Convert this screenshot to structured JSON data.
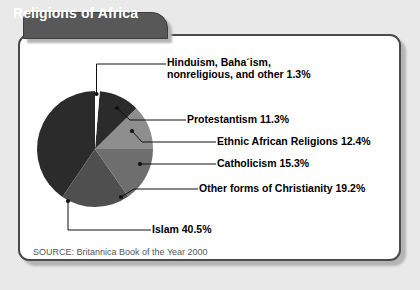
{
  "page": {
    "background_color": "#e9e9e9",
    "panel_background": "#ffffff",
    "panel_border_color": "#4a4a4a"
  },
  "header": {
    "title": "Religions of Africa",
    "tab_background": "#585858",
    "tab_text_color": "#ffffff"
  },
  "source": {
    "text": "SOURCE: Britannica Book of the Year 2000"
  },
  "chart_data": {
    "type": "pie",
    "title": "Religions of Africa",
    "grid": false,
    "legend_position": "callout-labels-right",
    "total": 100.0,
    "units": "percent",
    "categories": [
      "Hinduism, Baha´ism, nonreligious, and other",
      "Protestantism",
      "Ethnic African Religions",
      "Catholicism",
      "Other forms of Christianity",
      "Islam"
    ],
    "values": [
      1.3,
      11.3,
      12.4,
      15.3,
      19.2,
      40.5
    ],
    "colors": [
      "#ffffff",
      "#2b2b2b",
      "#8e8e8e",
      "#6e6e6e",
      "#4f4f4f",
      "#2b2b2b"
    ],
    "slices": [
      {
        "label_line1": "Hinduism, Baha´ism,",
        "label_line2": "nonreligious, and other 1.3%",
        "label": "Hinduism, Baha´ism, nonreligious, and other 1.3%",
        "value": 1.3,
        "color": "#ffffff"
      },
      {
        "label": "Protestantism 11.3%",
        "value": 11.3,
        "color": "#2b2b2b"
      },
      {
        "label": "Ethnic African Religions 12.4%",
        "value": 12.4,
        "color": "#8e8e8e"
      },
      {
        "label": "Catholicism 15.3%",
        "value": 15.3,
        "color": "#6e6e6e"
      },
      {
        "label": "Other forms of Christianity 19.2%",
        "value": 19.2,
        "color": "#4f4f4f"
      },
      {
        "label": "Islam 40.5%",
        "value": 40.5,
        "color": "#2b2b2b"
      }
    ]
  }
}
